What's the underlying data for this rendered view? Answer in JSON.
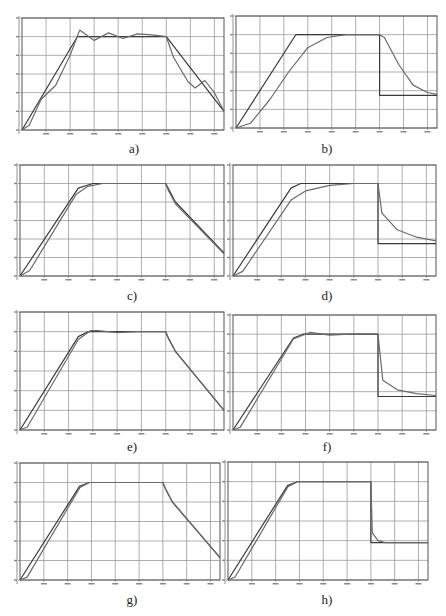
{
  "chart_data": [
    {
      "id": "a",
      "label": "a)",
      "type": "line",
      "xlim": [
        0,
        4200
      ],
      "ylim": [
        0,
        120
      ],
      "xticks": [
        500,
        1000,
        1500,
        2000,
        2500,
        3000,
        3500,
        4000
      ],
      "yticks": [
        0,
        20,
        40,
        60,
        80,
        100,
        120
      ],
      "grid": true,
      "series": [
        {
          "name": "reference",
          "x": [
            0,
            1150,
            3000,
            4200
          ],
          "y": [
            0,
            100,
            100,
            20
          ]
        },
        {
          "name": "response",
          "x": [
            0,
            150,
            400,
            700,
            1000,
            1200,
            1500,
            1800,
            2100,
            2400,
            2700,
            3000,
            3150,
            3450,
            3600,
            3800,
            4000,
            4200
          ],
          "y": [
            0,
            5,
            33,
            48,
            80,
            107,
            96,
            104,
            98,
            103,
            102,
            100,
            78,
            52,
            45,
            53,
            40,
            20
          ]
        }
      ]
    },
    {
      "id": "b",
      "label": "b)",
      "type": "line",
      "xlim": [
        0,
        4200
      ],
      "ylim": [
        0,
        120
      ],
      "xticks": [
        500,
        1000,
        1500,
        2000,
        2500,
        3000,
        3500,
        4000
      ],
      "yticks": [
        0,
        20,
        40,
        60,
        80,
        100,
        120
      ],
      "grid": true,
      "series": [
        {
          "name": "reference",
          "x": [
            0,
            1250,
            3000,
            3000,
            4200
          ],
          "y": [
            0,
            100,
            100,
            35,
            35
          ]
        },
        {
          "name": "response",
          "x": [
            0,
            300,
            700,
            1100,
            1500,
            1900,
            2300,
            3000,
            3100,
            3400,
            3700,
            4000,
            4200
          ],
          "y": [
            0,
            5,
            30,
            60,
            86,
            97,
            100,
            100,
            97,
            68,
            46,
            38,
            36
          ]
        }
      ]
    },
    {
      "id": "c",
      "label": "c)",
      "type": "line",
      "xlim": [
        0,
        4200
      ],
      "ylim": [
        0,
        120
      ],
      "xticks": [
        500,
        1000,
        1500,
        2000,
        2500,
        3000,
        3500,
        4000
      ],
      "yticks": [
        0,
        20,
        40,
        60,
        80,
        100,
        120
      ],
      "grid": true,
      "series": [
        {
          "name": "reference",
          "x": [
            0,
            1200,
            1500,
            3000,
            3050,
            3200,
            4200
          ],
          "y": [
            0,
            95,
            100,
            100,
            95,
            80,
            25
          ]
        },
        {
          "name": "response",
          "x": [
            0,
            200,
            1150,
            1400,
            1700,
            3000,
            3050,
            3200,
            4200
          ],
          "y": [
            0,
            6,
            88,
            97,
            100,
            100,
            93,
            78,
            24
          ]
        }
      ]
    },
    {
      "id": "d",
      "label": "d)",
      "type": "line",
      "xlim": [
        0,
        4200
      ],
      "ylim": [
        0,
        120
      ],
      "xticks": [
        500,
        1000,
        1500,
        2000,
        2500,
        3000,
        3500,
        4000
      ],
      "yticks": [
        0,
        20,
        40,
        60,
        80,
        100,
        120
      ],
      "grid": true,
      "series": [
        {
          "name": "reference",
          "x": [
            0,
            1200,
            1400,
            3000,
            3000,
            4200
          ],
          "y": [
            0,
            95,
            100,
            100,
            35,
            35
          ]
        },
        {
          "name": "response",
          "x": [
            0,
            200,
            1200,
            1500,
            2000,
            2500,
            3000,
            3080,
            3400,
            3800,
            4200
          ],
          "y": [
            0,
            5,
            82,
            92,
            98,
            100,
            100,
            68,
            50,
            42,
            38
          ]
        }
      ]
    },
    {
      "id": "e",
      "label": "e)",
      "type": "line",
      "xlim": [
        0,
        4200
      ],
      "ylim": [
        0,
        120
      ],
      "xticks": [
        500,
        1000,
        1500,
        2000,
        2500,
        3000,
        3500,
        4000
      ],
      "yticks": [
        0,
        20,
        40,
        60,
        80,
        100,
        120
      ],
      "grid": true,
      "series": [
        {
          "name": "reference",
          "x": [
            0,
            1200,
            1400,
            3000,
            3050,
            3200,
            4200
          ],
          "y": [
            0,
            95,
            100,
            100,
            94,
            80,
            20
          ]
        },
        {
          "name": "response",
          "x": [
            0,
            150,
            1200,
            1450,
            1600,
            2000,
            2400,
            3000,
            3050,
            3200,
            4200
          ],
          "y": [
            0,
            3,
            92,
            101,
            101,
            99,
            100,
            100,
            94,
            80,
            20
          ]
        }
      ]
    },
    {
      "id": "f",
      "label": "f)",
      "type": "line",
      "xlim": [
        0,
        4200
      ],
      "ylim": [
        0,
        120
      ],
      "xticks": [
        500,
        1000,
        1500,
        2000,
        2500,
        3000,
        3500,
        4000
      ],
      "yticks": [
        0,
        20,
        40,
        60,
        80,
        100,
        120
      ],
      "grid": true,
      "series": [
        {
          "name": "reference",
          "x": [
            0,
            1250,
            1450,
            3000,
            3000,
            4200
          ],
          "y": [
            0,
            96,
            100,
            100,
            35,
            35
          ]
        },
        {
          "name": "response",
          "x": [
            0,
            150,
            1250,
            1600,
            2000,
            2400,
            3000,
            3100,
            3400,
            3800,
            4200
          ],
          "y": [
            0,
            3,
            95,
            102,
            99,
            100,
            100,
            52,
            42,
            38,
            36
          ]
        }
      ]
    },
    {
      "id": "g",
      "label": "g)",
      "type": "line",
      "xlim": [
        0,
        4200
      ],
      "ylim": [
        0,
        120
      ],
      "xticks": [
        500,
        1000,
        1500,
        2000,
        2500,
        3000,
        3500,
        4000
      ],
      "yticks": [
        0,
        20,
        40,
        60,
        80,
        100,
        120
      ],
      "grid": true,
      "series": [
        {
          "name": "reference",
          "x": [
            0,
            1250,
            1450,
            3000,
            3050,
            3200,
            4200
          ],
          "y": [
            0,
            96,
            100,
            100,
            94,
            80,
            23
          ]
        },
        {
          "name": "response",
          "x": [
            0,
            150,
            1260,
            1460,
            3000,
            3050,
            3200,
            4200
          ],
          "y": [
            0,
            3,
            95,
            100,
            100,
            94,
            80,
            23
          ]
        }
      ]
    },
    {
      "id": "h",
      "label": "h)",
      "type": "line",
      "xlim": [
        0,
        4200
      ],
      "ylim": [
        0,
        120
      ],
      "xticks": [
        500,
        1000,
        1500,
        2000,
        2500,
        3000,
        3500,
        4000
      ],
      "yticks": [
        0,
        20,
        40,
        60,
        80,
        100,
        120
      ],
      "grid": true,
      "series": [
        {
          "name": "reference",
          "x": [
            0,
            1250,
            1450,
            3000,
            3000,
            4200
          ],
          "y": [
            0,
            96,
            100,
            100,
            38,
            38
          ]
        },
        {
          "name": "response",
          "x": [
            0,
            150,
            1260,
            1460,
            3000,
            3030,
            3150,
            3300,
            4200
          ],
          "y": [
            0,
            3,
            95,
            100,
            100,
            48,
            40,
            38,
            38
          ]
        }
      ]
    }
  ],
  "layout": [
    {
      "id": "a",
      "left": 22,
      "top": 18,
      "width": 202,
      "height": 112,
      "labelX": 134,
      "labelY": 141
    },
    {
      "id": "b",
      "left": 236,
      "top": 16,
      "width": 201,
      "height": 112,
      "labelX": 327,
      "labelY": 141
    },
    {
      "id": "c",
      "left": 20,
      "top": 165,
      "width": 204,
      "height": 111,
      "labelX": 132,
      "labelY": 288
    },
    {
      "id": "d",
      "left": 233,
      "top": 165,
      "width": 203,
      "height": 111,
      "labelX": 327,
      "labelY": 288
    },
    {
      "id": "e",
      "left": 20,
      "top": 312,
      "width": 204,
      "height": 118,
      "labelX": 132,
      "labelY": 439
    },
    {
      "id": "f",
      "left": 233,
      "top": 315,
      "width": 203,
      "height": 115,
      "labelX": 327,
      "labelY": 439
    },
    {
      "id": "g",
      "left": 20,
      "top": 463,
      "width": 200,
      "height": 117,
      "labelX": 132,
      "labelY": 592
    },
    {
      "id": "h",
      "left": 228,
      "top": 462,
      "width": 200,
      "height": 118,
      "labelX": 327,
      "labelY": 592
    }
  ],
  "colors": {
    "grid": "#9a9a9a",
    "frame": "#555555",
    "reference": "#3a3a3a",
    "response": "#6a6a6a"
  }
}
